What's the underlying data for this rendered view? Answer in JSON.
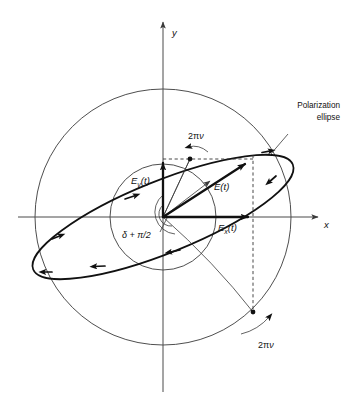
{
  "figure": {
    "background_color": "#ffffff",
    "line_color": "#111111",
    "thin_line_color": "#3a3a3a"
  },
  "axes": {
    "x_label": "x",
    "y_label": "y",
    "origin": {
      "x": 163,
      "y": 217
    }
  },
  "labels": {
    "field_total": "E",
    "field_total_arg": "(t)",
    "field_x": "E",
    "field_x_sub": "x",
    "field_x_arg": "(t)",
    "field_y": "E",
    "field_y_sub": "y",
    "field_y_arg": "(t)",
    "phase": "δ + π/2",
    "angular_rate_upper": "2π",
    "angular_rate_upper_nu": "ν",
    "angular_rate_lower": "2π",
    "angular_rate_lower_nu": "ν",
    "callout_line1": "Polarization",
    "callout_line2": "ellipse"
  },
  "geometry": {
    "outer_circle_radius": 128,
    "inner_circle_radius": 53,
    "ellipse_semi_major": 140,
    "ellipse_semi_minor": 36,
    "ellipse_tilt_degrees": -22,
    "dashed_vertical_x": 253,
    "dashed_horizontal_y": 159,
    "vector_tip": {
      "x": 248,
      "y": 163
    },
    "y_component_tip": {
      "x": 163,
      "y": 160
    },
    "x_component_tip": {
      "x": 251,
      "y": 217
    },
    "upper_dot": {
      "x": 190,
      "y": 159
    },
    "lower_dot": {
      "x": 253,
      "y": 312
    }
  }
}
